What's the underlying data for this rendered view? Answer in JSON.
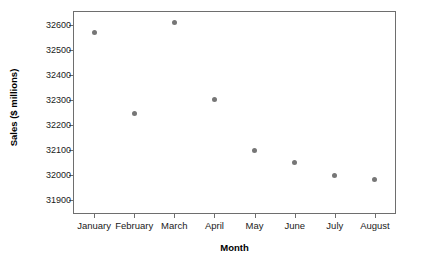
{
  "chart_data": {
    "type": "scatter",
    "title": "",
    "subtitle": "",
    "xlabel": "Month",
    "ylabel": "Sales ($ millions)",
    "categories": [
      "January",
      "February",
      "March",
      "April",
      "May",
      "June",
      "July",
      "August"
    ],
    "values": [
      32570,
      32245,
      32610,
      32300,
      32100,
      32050,
      32000,
      31985
    ],
    "series": [
      {
        "name": "Sales",
        "values": [
          32570,
          32245,
          32610,
          32300,
          32100,
          32050,
          32000,
          31985
        ]
      }
    ],
    "ytick_labels": [
      "32600",
      "32500",
      "32400",
      "32300",
      "32200",
      "32100",
      "32000",
      "31900"
    ],
    "ytick_values": [
      32600,
      32500,
      32400,
      32300,
      32200,
      32100,
      32000,
      31900
    ],
    "ylim": [
      31850,
      32650
    ],
    "grid": false,
    "legend": false,
    "legend_position": "none",
    "marker_color": "#767676",
    "axis_color": "#6e6e6e",
    "background_color": "#ffffff"
  }
}
